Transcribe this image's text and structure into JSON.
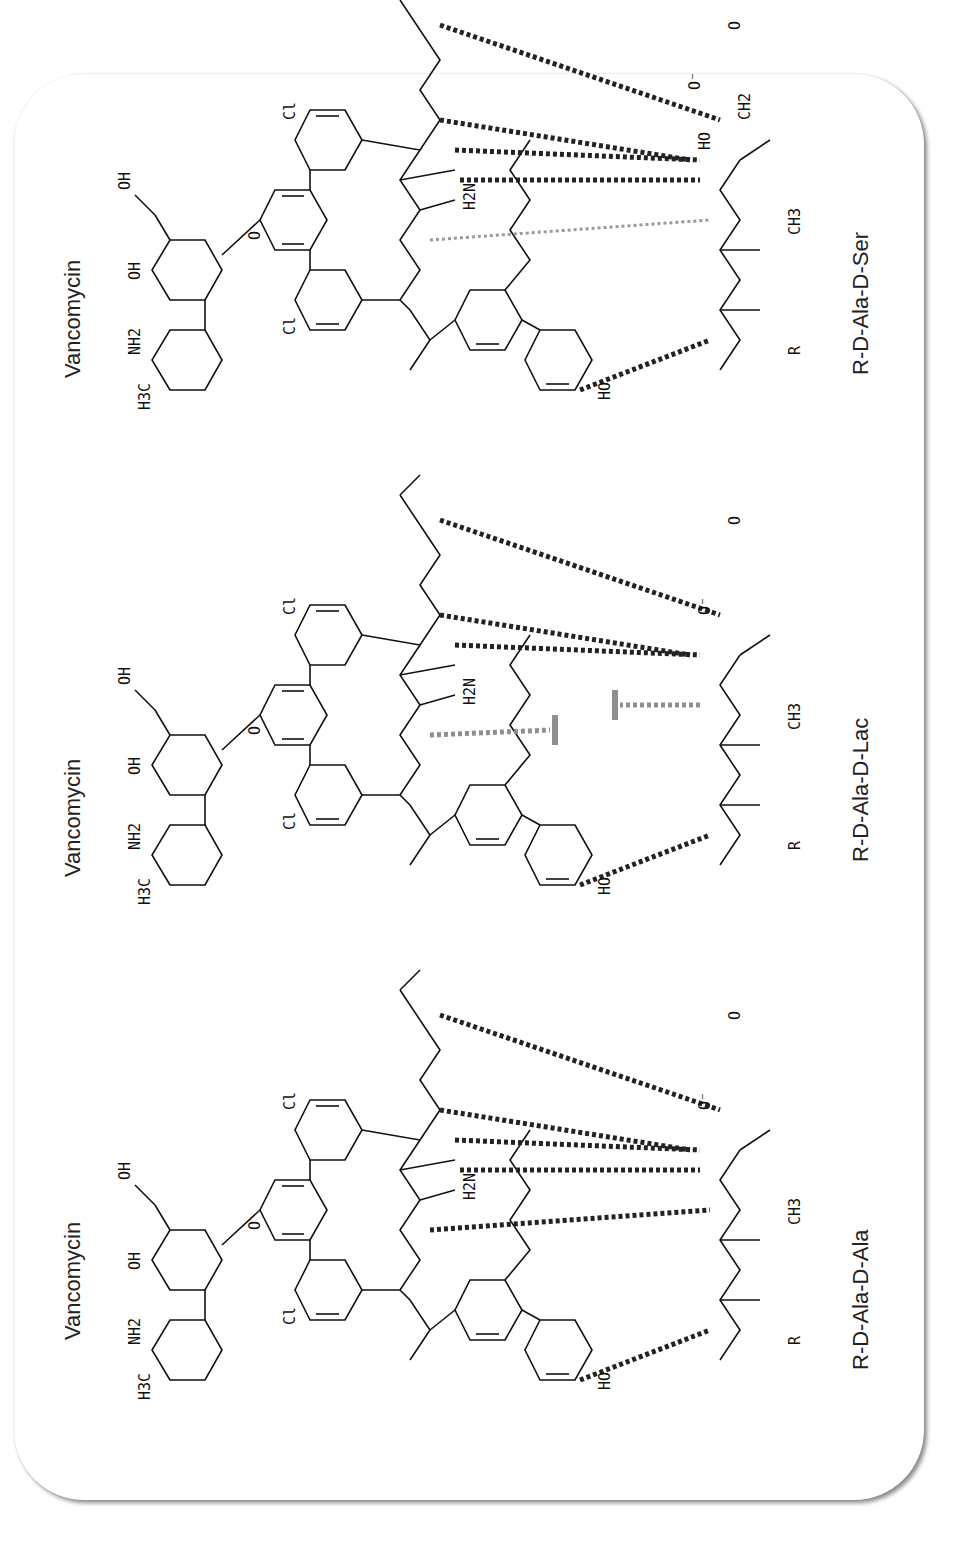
{
  "figure": {
    "panels": [
      {
        "id": "d-ala-d-ala",
        "antibiotic_label": "Vancomycin",
        "ligand_label": "R-D-Ala-D-Ala",
        "ligand_terminal_group": "CH3",
        "linking_atom": "NH",
        "hydrogen_bonds": {
          "total": 5,
          "lost": 0,
          "repulsive": 0
        },
        "atom_labels": [
          "H3C",
          "NH2",
          "HO",
          "OH",
          "O",
          "Cl",
          "H",
          "N",
          "H2N",
          "HO2C",
          "HN",
          "R",
          "CH3",
          "O-"
        ]
      },
      {
        "id": "d-ala-d-lac",
        "antibiotic_label": "Vancomycin",
        "ligand_label": "R-D-Ala-D-Lac",
        "ligand_terminal_group": "CH3",
        "linking_atom": "O",
        "hydrogen_bonds": {
          "total": 4,
          "lost": 1,
          "repulsive": 1
        },
        "atom_labels": [
          "H3C",
          "NH2",
          "HO",
          "OH",
          "O",
          "Cl",
          "H",
          "N",
          "H2N",
          "HO2C",
          "HN",
          "R",
          "CH3",
          "O-"
        ]
      },
      {
        "id": "d-ala-d-ser",
        "antibiotic_label": "Vancomycin",
        "ligand_label": "R-D-Ala-D-Ser",
        "ligand_terminal_group": "CH2-OH",
        "linking_atom": "NH",
        "hydrogen_bonds": {
          "total": 5,
          "weakened": 1,
          "lost": 0
        },
        "atom_labels": [
          "H3C",
          "NH2",
          "HO",
          "OH",
          "O",
          "Cl",
          "H",
          "N",
          "H2N",
          "HO2C",
          "HN",
          "R",
          "CH3",
          "CH2",
          "HO",
          "O-"
        ]
      }
    ],
    "colors": {
      "bond": "#111111",
      "hbond": "#222222",
      "hbond_weak": "#9a9a9a",
      "repulsion": "#8f8f8f",
      "card_shadow": "#7a7a7a"
    }
  }
}
